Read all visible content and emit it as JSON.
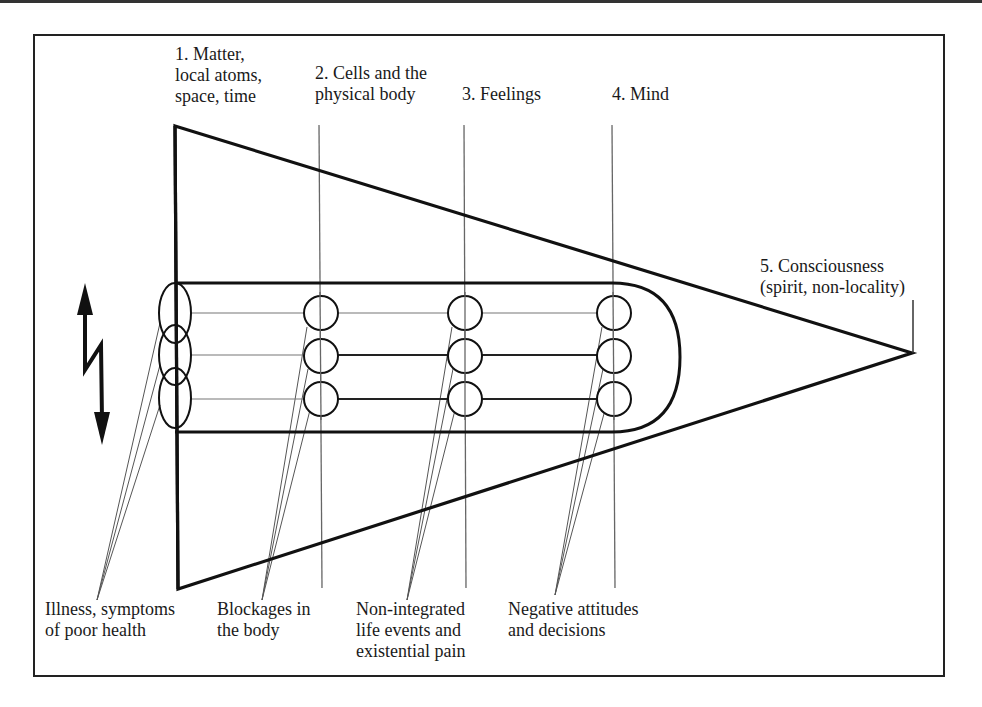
{
  "diagram": {
    "levels": [
      {
        "id": 1,
        "label": "1. Matter,\nlocal atoms,\nspace, time"
      },
      {
        "id": 2,
        "label": "2. Cells and the\nphysical body"
      },
      {
        "id": 3,
        "label": "3. Feelings"
      },
      {
        "id": 4,
        "label": "4. Mind"
      },
      {
        "id": 5,
        "label": "5. Consciousness\n(spirit, non-locality)"
      }
    ],
    "bottom_labels": [
      {
        "id": "illness",
        "label": "Illness, symptoms\nof poor health"
      },
      {
        "id": "blockages",
        "label": "Blockages in\nthe body"
      },
      {
        "id": "non-integrated",
        "label": "Non-integrated\nlife events and\nexistential pain"
      },
      {
        "id": "negative",
        "label": "Negative attitudes\nand decisions"
      }
    ],
    "icons": {
      "left_arrow": "double-headed-lightning-arrow-icon"
    },
    "colors": {
      "stroke": "#111111",
      "thin_stroke": "#555555",
      "background": "#ffffff"
    }
  }
}
